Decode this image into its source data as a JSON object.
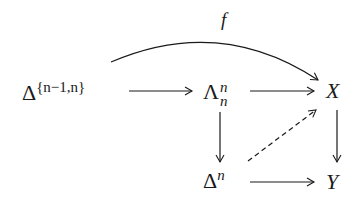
{
  "diagram": {
    "type": "commutative-diagram",
    "nodes": {
      "delta_boundary": {
        "base": "Δ",
        "sup": "{n−1,n}"
      },
      "horn": {
        "base": "Λ",
        "sup": "n",
        "sub": "n"
      },
      "X": {
        "base": "X"
      },
      "simplex": {
        "base": "Δ",
        "sup": "n"
      },
      "Y": {
        "base": "Y"
      }
    },
    "arrows": [
      {
        "from": "delta_boundary",
        "to": "X",
        "label": "f",
        "style": "curved"
      },
      {
        "from": "delta_boundary",
        "to": "horn",
        "label": "",
        "style": "solid"
      },
      {
        "from": "horn",
        "to": "X",
        "label": "",
        "style": "solid"
      },
      {
        "from": "horn",
        "to": "simplex",
        "label": "",
        "style": "solid"
      },
      {
        "from": "X",
        "to": "Y",
        "label": "",
        "style": "solid"
      },
      {
        "from": "simplex",
        "to": "Y",
        "label": "",
        "style": "solid"
      },
      {
        "from": "simplex",
        "to": "X",
        "label": "",
        "style": "dashed"
      }
    ],
    "curved_label": "f"
  }
}
